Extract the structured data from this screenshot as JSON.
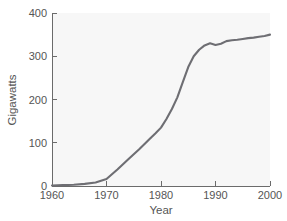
{
  "chart_data": {
    "type": "line",
    "title": "",
    "subtitle": "",
    "xlabel": "Year",
    "ylabel": "Gigawatts",
    "xlim": [
      1960,
      2000
    ],
    "ylim": [
      0,
      400
    ],
    "grid": false,
    "legend": null,
    "x_ticks": [
      1960,
      1970,
      1980,
      1990,
      2000
    ],
    "y_ticks": [
      0,
      100,
      200,
      300,
      400
    ],
    "x_tick_labels": [
      "1960",
      "1970",
      "1980",
      "1990",
      "2000"
    ],
    "y_tick_labels": [
      "0",
      "100",
      "200",
      "300",
      "400"
    ],
    "line_color": "#6e6e73",
    "plot_background": "#f7f7f7",
    "series": [
      {
        "name": "Nuclear generating capacity",
        "units": "Gigawatts",
        "x": [
          1960,
          1962,
          1964,
          1966,
          1968,
          1970,
          1972,
          1974,
          1976,
          1978,
          1979,
          1980,
          1981,
          1982,
          1983,
          1984,
          1985,
          1986,
          1987,
          1988,
          1989,
          1990,
          1991,
          1992,
          1993,
          1994,
          1995,
          1996,
          1997,
          1998,
          1999,
          2000
        ],
        "values": [
          1,
          2,
          3,
          5,
          8,
          16,
          38,
          62,
          85,
          110,
          122,
          135,
          155,
          178,
          205,
          240,
          275,
          300,
          315,
          325,
          330,
          326,
          329,
          335,
          337,
          338,
          340,
          342,
          343,
          345,
          347,
          350
        ]
      }
    ]
  },
  "axes": {
    "y_axis_label": "Gigawatts",
    "x_axis_label": "Year"
  }
}
